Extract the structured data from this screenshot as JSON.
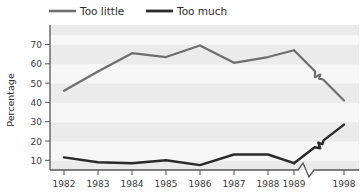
{
  "chart_data": {
    "type": "line",
    "title": "",
    "xlabel": "",
    "ylabel": "Percentage",
    "ylim": [
      0,
      75
    ],
    "yticks": [
      10,
      20,
      30,
      40,
      50,
      60,
      70
    ],
    "grid": true,
    "grid_style": "alternating-horizontal-bands",
    "legend_position": "top",
    "axis_break": {
      "axis": "x",
      "between": [
        "1989",
        "1998"
      ],
      "marker": "zigzag"
    },
    "categories": [
      "1982",
      "1983",
      "1984",
      "1985",
      "1986",
      "1987",
      "1988",
      "1989",
      "1998"
    ],
    "series": [
      {
        "name": "Too little",
        "color": "#6e6e6e",
        "values": [
          46,
          56,
          65.5,
          63.5,
          69.5,
          60.5,
          63.5,
          67,
          41
        ],
        "line_break_between": [
          "1989",
          "1998"
        ]
      },
      {
        "name": "Too much",
        "color": "#2a2a2a",
        "values": [
          11.5,
          9,
          8.5,
          10,
          7.5,
          13,
          13,
          8.5,
          28.5
        ],
        "line_break_between": [
          "1989",
          "1998"
        ]
      }
    ]
  },
  "legend": {
    "items": [
      {
        "label": "Too little",
        "color": "#6e6e6e"
      },
      {
        "label": "Too much",
        "color": "#2a2a2a"
      }
    ]
  },
  "axes": {
    "y_title": "Percentage",
    "y_tick_labels": [
      "70",
      "60",
      "50",
      "40",
      "30",
      "20",
      "10"
    ],
    "x_tick_labels": [
      "1982",
      "1983",
      "1984",
      "1985",
      "1986",
      "1987",
      "1988",
      "1989",
      "1998"
    ]
  },
  "colors": {
    "background": "#ffffff",
    "plot_band_light": "#ebebeb",
    "plot_band_white": "#f7f7f7",
    "axis": "#555555",
    "series_too_little": "#6e6e6e",
    "series_too_much": "#2a2a2a"
  }
}
